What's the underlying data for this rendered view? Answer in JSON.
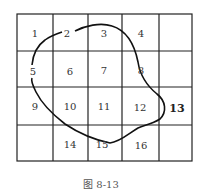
{
  "figure": {
    "caption": "图 8-13",
    "grid": {
      "rows": 4,
      "cols": 5
    },
    "cells": [
      {
        "label": "1",
        "row": 0,
        "col": 0
      },
      {
        "label": "2",
        "row": 0,
        "col": 1
      },
      {
        "label": "3",
        "row": 0,
        "col": 2
      },
      {
        "label": "4",
        "row": 0,
        "col": 3
      },
      {
        "label": "",
        "row": 0,
        "col": 4
      },
      {
        "label": "5",
        "row": 1,
        "col": 0
      },
      {
        "label": "6",
        "row": 1,
        "col": 1
      },
      {
        "label": "7",
        "row": 1,
        "col": 2
      },
      {
        "label": "8",
        "row": 1,
        "col": 3
      },
      {
        "label": "",
        "row": 1,
        "col": 4
      },
      {
        "label": "9",
        "row": 2,
        "col": 0
      },
      {
        "label": "10",
        "row": 2,
        "col": 1
      },
      {
        "label": "11",
        "row": 2,
        "col": 2
      },
      {
        "label": "12",
        "row": 2,
        "col": 3
      },
      {
        "label": "13",
        "row": 2,
        "col": 4
      },
      {
        "label": "",
        "row": 3,
        "col": 0
      },
      {
        "label": "14",
        "row": 3,
        "col": 1
      },
      {
        "label": "15",
        "row": 3,
        "col": 2
      },
      {
        "label": "16",
        "row": 3,
        "col": 3
      },
      {
        "label": "",
        "row": 3,
        "col": 4
      }
    ],
    "closed_curve_through": [
      "2",
      "3",
      "8",
      "13",
      "15",
      "9",
      "5"
    ],
    "highlighted_label": "13"
  }
}
